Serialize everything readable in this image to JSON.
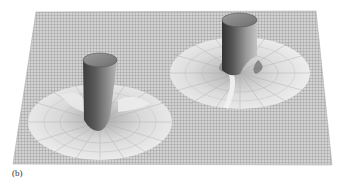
{
  "figure": {
    "label": "(b)",
    "colors": {
      "background": "#ffffff",
      "mesh_fill": "#cfcfcf",
      "mesh_line": "#8a8a8a",
      "funnel_light": "#e6e6e6",
      "funnel_mid": "#bdbdbd",
      "tube_dark": "#4a4a4a",
      "tube_light": "#b5b5b5"
    }
  }
}
